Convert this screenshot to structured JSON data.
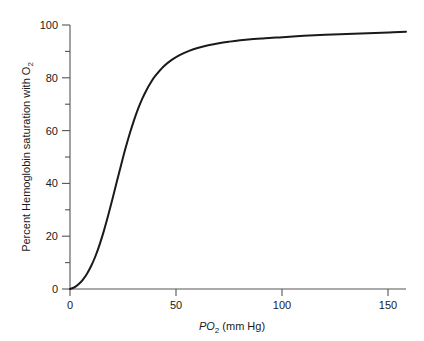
{
  "chart_data": {
    "type": "line",
    "title": "",
    "subtitle": "",
    "xlabel_parts": {
      "italic": "PO",
      "subscript": "2",
      "rest": " (mm Hg)"
    },
    "xlabel": "PO2 (mm Hg)",
    "ylabel_parts": {
      "main": "Percent Hemoglobin saturation with O",
      "subscript": "2"
    },
    "ylabel": "Percent Hemoglobin saturation with O2",
    "xlim": [
      0,
      158
    ],
    "ylim": [
      0,
      100
    ],
    "grid": false,
    "legend": null,
    "x_major_ticks": [
      0,
      50,
      100,
      150
    ],
    "x_major_tick_labels": [
      "0",
      "50",
      "100",
      "150"
    ],
    "x_minor_ticks": [],
    "y_major_ticks": [
      0,
      20,
      40,
      60,
      80,
      100
    ],
    "y_major_tick_labels": [
      "0",
      "20",
      "40",
      "60",
      "80",
      "100"
    ],
    "y_minor_ticks": [
      10,
      30,
      50,
      70,
      90
    ],
    "series": [
      {
        "name": "Oxygen-hemoglobin dissociation curve",
        "color": "#1a1a1a",
        "linewidth": 2,
        "x": [
          0,
          2,
          4,
          6,
          8,
          10,
          12,
          14,
          16,
          18,
          20,
          22,
          24,
          26,
          28,
          30,
          32,
          34,
          36,
          38,
          40,
          44,
          48,
          52,
          56,
          60,
          65,
          70,
          75,
          80,
          85,
          90,
          95,
          100,
          110,
          120,
          130,
          140,
          150,
          158
        ],
        "y": [
          0,
          0.6,
          1.8,
          3.5,
          5.8,
          8.8,
          12.5,
          17.0,
          22.2,
          28.0,
          34.2,
          40.6,
          46.9,
          53.0,
          58.6,
          63.7,
          68.2,
          72.1,
          75.4,
          78.2,
          80.6,
          84.3,
          86.9,
          88.8,
          90.2,
          91.3,
          92.3,
          93.1,
          93.7,
          94.2,
          94.6,
          94.9,
          95.2,
          95.4,
          95.9,
          96.3,
          96.6,
          96.9,
          97.2,
          97.4
        ]
      }
    ],
    "annotations": [],
    "p50_mm_hg": 27,
    "axis_color": "#555555",
    "line_color": "#1a1a1a",
    "background_color": "#ffffff"
  }
}
